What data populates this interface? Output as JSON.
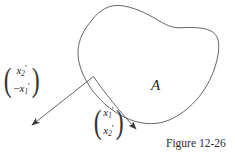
{
  "figure": {
    "caption": "Figure 12-26",
    "region_label": "A",
    "background_color": "#ffffff",
    "stroke_color": "#4a4a4a",
    "text_color": "#242424"
  },
  "vectors": [
    {
      "id": "rotated-vector",
      "position": "left",
      "entries": [
        {
          "sign": "",
          "symbol": "x",
          "subscript": "2",
          "prime": "′"
        },
        {
          "sign": "−",
          "symbol": "x",
          "subscript": "1",
          "prime": "′"
        }
      ],
      "plain_text": "(x2', -x1')"
    },
    {
      "id": "original-vector",
      "position": "bottom-center",
      "entries": [
        {
          "sign": "",
          "symbol": "x",
          "subscript": "1",
          "prime": "′"
        },
        {
          "sign": "",
          "symbol": "x",
          "subscript": "2",
          "prime": "′"
        }
      ],
      "plain_text": "(x1', x2')"
    }
  ],
  "arrows": [
    {
      "id": "arrow-to-rotated-vector",
      "from": [
        93,
        76
      ],
      "to": [
        28,
        128
      ],
      "direction": "down-left"
    },
    {
      "id": "arrow-to-original-vector",
      "from": [
        93,
        76
      ],
      "to": [
        141,
        134
      ],
      "direction": "down-right"
    }
  ],
  "shapes": [
    {
      "id": "region-blob",
      "type": "closed-curve",
      "label": "A"
    }
  ]
}
